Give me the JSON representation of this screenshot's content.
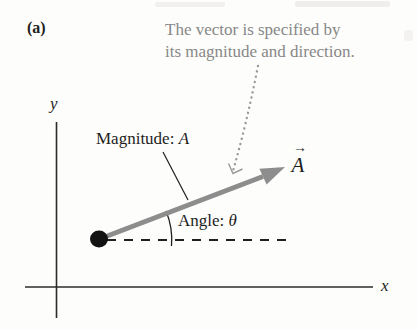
{
  "figure": {
    "panel_label": "(a)",
    "annotation": {
      "line1": "The vector is specified by",
      "line2": "its magnitude and direction."
    },
    "vector": {
      "symbol": "A",
      "arrow_accent": "→"
    },
    "callouts": {
      "magnitude_text": "Magnitude:",
      "magnitude_symbol": "A",
      "angle_text": "Angle:",
      "angle_symbol": "θ"
    },
    "axes": {
      "x_label": "x",
      "y_label": "y"
    },
    "colors": {
      "vector_gray": "#8d8d8d",
      "annotation_gray": "#888888",
      "ink_black": "#1e1e1e",
      "paper": "#fdfdfb"
    }
  }
}
